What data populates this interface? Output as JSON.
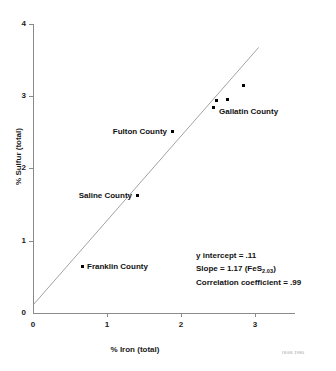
{
  "chart_data": {
    "type": "scatter",
    "title": "",
    "xlabel": "% Iron (total)",
    "ylabel": "% Sulfur (total)",
    "xlim": [
      0,
      3.5
    ],
    "ylim": [
      0,
      4
    ],
    "xticks": [
      "0",
      "1",
      "2",
      "3"
    ],
    "xtick_values": [
      0,
      1,
      2,
      3
    ],
    "yticks": [
      "0",
      "1",
      "2",
      "3",
      "4"
    ],
    "ytick_values": [
      0,
      1,
      2,
      3,
      4
    ],
    "grid": false,
    "legend": "none",
    "points": [
      {
        "label": "Franklin County",
        "x": 0.66,
        "y": 0.65,
        "label_position": "right"
      },
      {
        "label": "Saline County",
        "x": 1.4,
        "y": 1.65,
        "label_position": "left"
      },
      {
        "label": "Fulton County",
        "x": 1.88,
        "y": 2.55,
        "label_position": "left"
      },
      {
        "label": "Gallatin County",
        "x": 2.43,
        "y": 2.89,
        "label_position": "right"
      },
      {
        "label": "",
        "x": 2.47,
        "y": 2.99,
        "label_position": "none"
      },
      {
        "label": "",
        "x": 2.62,
        "y": 3.0,
        "label_position": "none"
      },
      {
        "label": "",
        "x": 2.84,
        "y": 3.2,
        "label_position": "none"
      }
    ],
    "fit_line": {
      "intercept": 0.11,
      "slope": 1.17,
      "x_start": 0.0,
      "x_end": 3.05
    },
    "annotations": {
      "y_intercept": "y intercept = .11",
      "slope_prefix": "Slope = 1.17 (FeS",
      "slope_subscript": "2.03",
      "slope_suffix": ")",
      "correlation": "Correlation coefficient = .99"
    }
  },
  "labels": {
    "x_axis_title": "% Iron (total)",
    "y_axis_title": "% Sulfur (total)",
    "source_credit": "ISGS 1980"
  }
}
